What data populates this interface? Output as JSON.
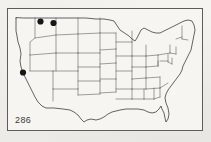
{
  "figure": {
    "type": "distribution-map",
    "region": "contiguous United States",
    "plate_number": "286",
    "caption_partial": "",
    "border_color": "#5d5c58",
    "paper_color": "#f3f2ef",
    "outline_color": "#3f3e3b",
    "state_line_color": "#55534f",
    "dot_color": "#171614"
  },
  "map": {
    "view_width": 196,
    "view_height": 123,
    "occurrence_label": "occurrence dot",
    "dots": [
      {
        "id": "dot-1",
        "cx": 32.5,
        "cy": 12.5,
        "r": 3.1,
        "area": "northwest-washington"
      },
      {
        "id": "dot-2",
        "cx": 45.5,
        "cy": 14.0,
        "r": 3.1,
        "area": "northern-idaho"
      },
      {
        "id": "dot-3",
        "cx": 15.0,
        "cy": 63.5,
        "r": 3.1,
        "area": "northern-california"
      }
    ],
    "dot_count": 3
  },
  "chart_data": {
    "type": "map",
    "title": "",
    "xlabel": "",
    "ylabel": "",
    "categories": [
      "northwest-washington",
      "northern-idaho",
      "northern-california"
    ],
    "values": [
      1,
      1,
      1
    ],
    "legend": [],
    "annotations": [
      "286"
    ]
  }
}
